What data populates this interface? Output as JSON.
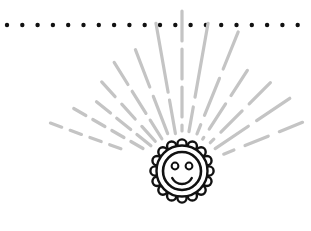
{
  "illustration": {
    "title": "Smiling sun with radiating rays",
    "colors": {
      "background": "#ffffff",
      "ink": "#111111",
      "rays": "#c4c4c4"
    },
    "dotted_line": {
      "y": 25,
      "x_start": 7,
      "spacing": 15.3,
      "count": 20,
      "dot_radius": 2.2
    },
    "sun": {
      "cx": 182,
      "cy": 171,
      "outer_radius": 27,
      "bump_count": 16,
      "bump_radius": 4.6,
      "face_radius": 19,
      "eye_offset_x": 7,
      "eye_offset_y": -5,
      "eye_radius": 3.4,
      "smile_radius": 11
    },
    "rays": [
      {
        "angle": 160,
        "r0": 58,
        "r1": 140,
        "dash": "12 9"
      },
      {
        "angle": 150,
        "r0": 45,
        "r1": 125,
        "dash": "14 8"
      },
      {
        "angle": 141,
        "r0": 40,
        "r1": 110,
        "dash": "18 8"
      },
      {
        "angle": 132,
        "r0": 38,
        "r1": 120,
        "dash": "20 10"
      },
      {
        "angle": 122,
        "r0": 38,
        "r1": 128,
        "dash": "26 8"
      },
      {
        "angle": 111,
        "r0": 40,
        "r1": 130,
        "dash": "40 10"
      },
      {
        "angle": 100,
        "r0": 38,
        "r1": 150,
        "dash": "70 8"
      },
      {
        "angle": 90,
        "r0": 40,
        "r1": 160,
        "dash": "30 8"
      },
      {
        "angle": 80,
        "r0": 40,
        "r1": 150,
        "dash": "75 10"
      },
      {
        "angle": 68,
        "r0": 40,
        "r1": 150,
        "dash": "40 10"
      },
      {
        "angle": 57,
        "r0": 38,
        "r1": 120,
        "dash": "30 10"
      },
      {
        "angle": 45,
        "r0": 40,
        "r1": 125,
        "dash": "30 10"
      },
      {
        "angle": 34,
        "r0": 40,
        "r1": 130,
        "dash": "40 10"
      },
      {
        "angle": 22,
        "r0": 45,
        "r1": 130,
        "dash": "25 12"
      }
    ]
  }
}
